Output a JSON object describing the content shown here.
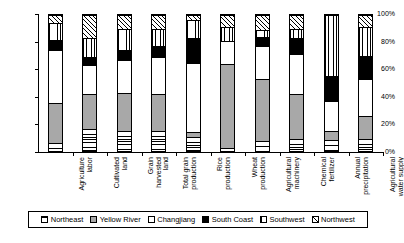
{
  "chart_data": {
    "type": "bar",
    "subtype": "stacked-percentage-column",
    "title": "",
    "xlabel": "",
    "ylabel": "",
    "ylim": [
      0,
      100
    ],
    "ytick_labels": [
      "0%",
      "20%",
      "40%",
      "60%",
      "80%",
      "100%"
    ],
    "ytick_values": [
      0,
      20,
      40,
      60,
      80,
      100
    ],
    "grid": false,
    "legend_position": "bottom",
    "stack_order_bottom_to_top": [
      "Northeast",
      "Yellow River",
      "Changjiang",
      "South Coast",
      "Southwest",
      "Northwest"
    ],
    "categories": [
      "Agriculture labor",
      "Cultivated land",
      "Grain harvested land",
      "Total grain production",
      "Rice production",
      "Wheat production",
      "Agricultural machinery",
      "Chemical fertilizer",
      "Annual precipitation",
      "Agricultural water supply"
    ],
    "category_labels_wrapped": [
      "Agriculture\nlabor",
      "Cultivated\nland",
      "Grain\nharvested\nland",
      "Total grain\nproduction",
      "Rice\nproduction",
      "Wheat\nproduction",
      "Agricultural\nmachinery",
      "Chemical\nfertilizer",
      "Annual\nprecipitation",
      "Agricultural\nwater supply"
    ],
    "series": [
      {
        "name": "Northeast",
        "pattern": "horizontal-lines",
        "color": "#ffffff",
        "values": [
          6,
          16,
          15,
          15,
          10,
          2,
          7,
          9,
          8,
          9
        ]
      },
      {
        "name": "Yellow River",
        "pattern": "solid-gray",
        "color": "#a8a8a8",
        "values": [
          29,
          26,
          28,
          27,
          4,
          62,
          46,
          33,
          7,
          17
        ]
      },
      {
        "name": "Changjiang",
        "pattern": "solid-white",
        "color": "#ffffff",
        "values": [
          39,
          21,
          24,
          27,
          51,
          17,
          24,
          29,
          22,
          27
        ]
      },
      {
        "name": "South Coast",
        "pattern": "solid-black",
        "color": "#000000",
        "values": [
          8,
          6,
          7,
          8,
          18,
          0,
          7,
          12,
          18,
          17
        ]
      },
      {
        "name": "Southwest",
        "pattern": "vertical-lines",
        "color": "#ffffff",
        "values": [
          12,
          14,
          16,
          13,
          13,
          10,
          5,
          7,
          45,
          21
        ]
      },
      {
        "name": "Northwest",
        "pattern": "diagonal-hatch",
        "color": "#ffffff",
        "values": [
          6,
          17,
          10,
          10,
          4,
          9,
          11,
          10,
          0,
          9
        ]
      }
    ]
  },
  "legend": {
    "items": [
      {
        "label": "Northeast",
        "pattern": "horizontal-lines"
      },
      {
        "label": "Yellow River",
        "pattern": "solid-gray"
      },
      {
        "label": "Changjiang",
        "pattern": "solid-white"
      },
      {
        "label": "South Coast",
        "pattern": "solid-black"
      },
      {
        "label": "Southwest",
        "pattern": "vertical-lines"
      },
      {
        "label": "Northwest",
        "pattern": "diagonal-hatch"
      }
    ]
  }
}
